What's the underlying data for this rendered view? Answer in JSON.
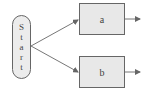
{
  "diagram": {
    "start_node": {
      "letters": [
        "S",
        "t",
        "a",
        "r",
        "t"
      ],
      "label": "Start"
    },
    "nodes": [
      {
        "id": "a",
        "label": "a"
      },
      {
        "id": "b",
        "label": "b"
      }
    ],
    "edges": [
      {
        "from": "Start",
        "to": "a"
      },
      {
        "from": "Start",
        "to": "b"
      },
      {
        "from": "a",
        "to": "out"
      },
      {
        "from": "b",
        "to": "out"
      }
    ],
    "colors": {
      "stroke": "#666666",
      "fill": "#e8e8e8",
      "text": "#444444"
    }
  }
}
